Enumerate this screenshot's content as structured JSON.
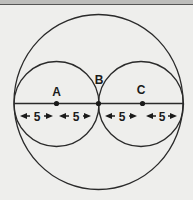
{
  "diagram": {
    "type": "geometry",
    "points": [
      {
        "name": "A",
        "label": "A"
      },
      {
        "name": "B",
        "label": "B"
      },
      {
        "name": "C",
        "label": "C"
      }
    ],
    "measurements": [
      {
        "segment": 1,
        "label": "5"
      },
      {
        "segment": 2,
        "label": "5"
      },
      {
        "segment": 3,
        "label": "5"
      },
      {
        "segment": 4,
        "label": "5"
      }
    ],
    "colors": {
      "stroke": "#2a2a2a",
      "background": "#eeeeec",
      "text": "#1a1a1a"
    }
  }
}
